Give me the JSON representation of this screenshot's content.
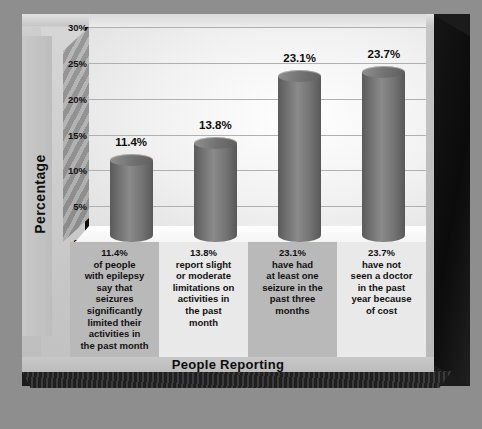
{
  "chart_data": {
    "type": "bar",
    "title": "",
    "xlabel": "People Reporting",
    "ylabel": "Percentage",
    "ylim": [
      0,
      30
    ],
    "ytick_labels": [
      "30%",
      "25%",
      "20%",
      "15%",
      "10%",
      "5%",
      "0%"
    ],
    "ytick_values": [
      30,
      25,
      20,
      15,
      10,
      5,
      0
    ],
    "grid": true,
    "legend": "none",
    "categories": [
      "11.4%\nof people\nwith epilepsy\nsay that\nseizures\nsignificantly\nlimited their\nactivities in\nthe past month",
      "13.8%\nreport slight\nor moderate\nlimitations on\nactivities in\nthe past\nmonth",
      "23.1%\nhave had\nat least one\nseizure in the\npast three\nmonths",
      "23.7%\nhave not\nseen a doctor\nin the past\nyear because\nof cost"
    ],
    "values": [
      11.4,
      13.8,
      23.1,
      23.7
    ],
    "data_labels": [
      "11.4%",
      "13.8%",
      "23.1%",
      "23.7%"
    ]
  },
  "colors": {
    "page_background": "#8e8e8e",
    "frame_face": "#c6c6c6",
    "frame_edge_dark": "#1b1b1b",
    "plot_wall_light": "#ffffff",
    "plot_wall_shade": "#cfcfcf",
    "gridline": "#b0b0b0",
    "bar_gray": "#7a7a7a",
    "bar_shadow": "#585858",
    "floor_white": "#ffffff",
    "band_dark": "#b9b9b9",
    "band_light": "#e9e9e9",
    "text": "#0d0d0d"
  }
}
